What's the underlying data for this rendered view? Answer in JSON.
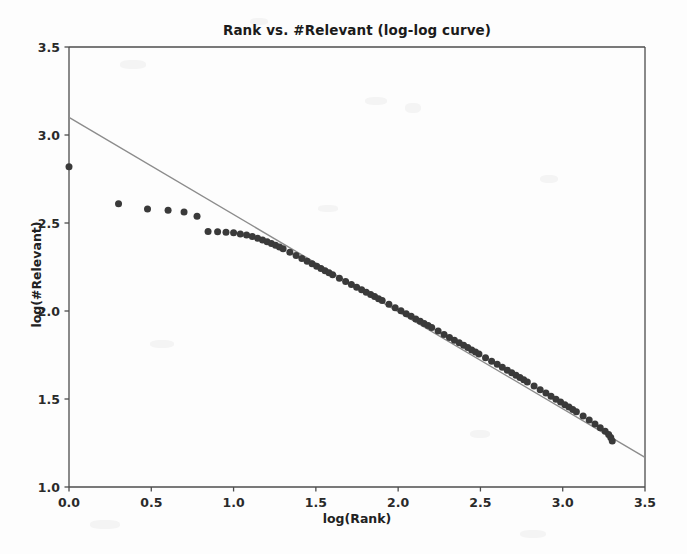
{
  "chart_data": {
    "type": "scatter",
    "title": "Rank vs. #Relevant (log-log curve)",
    "xlabel": "log(Rank)",
    "ylabel": "log(#Relevant)",
    "xlim": [
      0.0,
      3.5
    ],
    "ylim": [
      1.0,
      3.5
    ],
    "xticks": [
      "0.0",
      "0.5",
      "1.0",
      "1.5",
      "2.0",
      "2.5",
      "3.0",
      "3.5"
    ],
    "yticks": [
      "1.0",
      "1.5",
      "2.0",
      "2.5",
      "3.0",
      "3.5"
    ],
    "xtick_values": [
      0.0,
      0.5,
      1.0,
      1.5,
      2.0,
      2.5,
      3.0,
      3.5
    ],
    "ytick_values": [
      1.0,
      1.5,
      2.0,
      2.5,
      3.0,
      3.5
    ],
    "grid": false,
    "legend": null,
    "marker_color": "#3a3a3a",
    "marker_size": 7,
    "line_color": "#8c8c8c",
    "series": [
      {
        "name": "observed",
        "type": "scatter",
        "points": [
          [
            0.0,
            2.82
          ],
          [
            0.301,
            2.61
          ],
          [
            0.477,
            2.58
          ],
          [
            0.602,
            2.572
          ],
          [
            0.699,
            2.562
          ],
          [
            0.778,
            2.538
          ],
          [
            0.845,
            2.452
          ],
          [
            0.903,
            2.45
          ],
          [
            0.954,
            2.448
          ],
          [
            1.0,
            2.444
          ],
          [
            1.041,
            2.438
          ],
          [
            1.079,
            2.432
          ],
          [
            1.114,
            2.424
          ],
          [
            1.146,
            2.414
          ],
          [
            1.176,
            2.404
          ],
          [
            1.204,
            2.394
          ],
          [
            1.23,
            2.384
          ],
          [
            1.255,
            2.374
          ],
          [
            1.279,
            2.364
          ],
          [
            1.301,
            2.353
          ],
          [
            1.342,
            2.334
          ],
          [
            1.38,
            2.315
          ],
          [
            1.415,
            2.298
          ],
          [
            1.447,
            2.282
          ],
          [
            1.477,
            2.268
          ],
          [
            1.505,
            2.254
          ],
          [
            1.531,
            2.241
          ],
          [
            1.556,
            2.229
          ],
          [
            1.58,
            2.217
          ],
          [
            1.602,
            2.206
          ],
          [
            1.643,
            2.186
          ],
          [
            1.681,
            2.168
          ],
          [
            1.716,
            2.151
          ],
          [
            1.748,
            2.135
          ],
          [
            1.778,
            2.121
          ],
          [
            1.806,
            2.107
          ],
          [
            1.833,
            2.094
          ],
          [
            1.857,
            2.082
          ],
          [
            1.881,
            2.07
          ],
          [
            1.903,
            2.059
          ],
          [
            1.944,
            2.038
          ],
          [
            1.982,
            2.019
          ],
          [
            2.017,
            2.001
          ],
          [
            2.049,
            1.985
          ],
          [
            2.079,
            1.97
          ],
          [
            2.107,
            1.955
          ],
          [
            2.134,
            1.942
          ],
          [
            2.158,
            1.929
          ],
          [
            2.182,
            1.918
          ],
          [
            2.204,
            1.906
          ],
          [
            2.243,
            1.886
          ],
          [
            2.279,
            1.867
          ],
          [
            2.312,
            1.85
          ],
          [
            2.342,
            1.834
          ],
          [
            2.371,
            1.819
          ],
          [
            2.398,
            1.805
          ],
          [
            2.423,
            1.792
          ],
          [
            2.447,
            1.779
          ],
          [
            2.47,
            1.767
          ],
          [
            2.491,
            1.756
          ],
          [
            2.531,
            1.735
          ],
          [
            2.568,
            1.715
          ],
          [
            2.602,
            1.697
          ],
          [
            2.633,
            1.68
          ],
          [
            2.663,
            1.664
          ],
          [
            2.69,
            1.649
          ],
          [
            2.716,
            1.635
          ],
          [
            2.74,
            1.622
          ],
          [
            2.763,
            1.609
          ],
          [
            2.785,
            1.597
          ],
          [
            2.826,
            1.574
          ],
          [
            2.863,
            1.553
          ],
          [
            2.898,
            1.534
          ],
          [
            2.929,
            1.516
          ],
          [
            2.959,
            1.499
          ],
          [
            2.987,
            1.483
          ],
          [
            3.013,
            1.468
          ],
          [
            3.038,
            1.454
          ],
          [
            3.061,
            1.44
          ],
          [
            3.083,
            1.427
          ],
          [
            3.124,
            1.403
          ],
          [
            3.161,
            1.38
          ],
          [
            3.196,
            1.358
          ],
          [
            3.228,
            1.337
          ],
          [
            3.258,
            1.317
          ],
          [
            3.279,
            1.298
          ],
          [
            3.292,
            1.281
          ],
          [
            3.301,
            1.262
          ]
        ]
      },
      {
        "name": "log-log fit line",
        "type": "line",
        "points": [
          [
            0.0,
            3.1
          ],
          [
            3.5,
            1.168
          ]
        ]
      }
    ]
  }
}
